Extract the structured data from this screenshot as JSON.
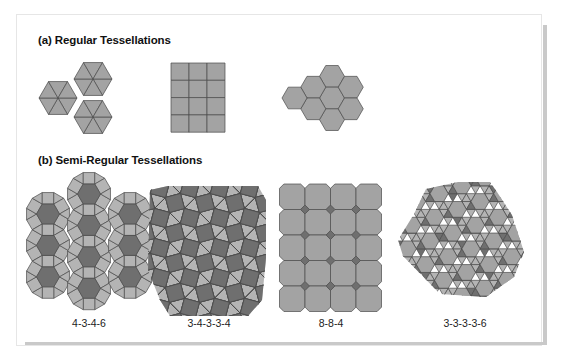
{
  "figure": {
    "section_a": {
      "title": "(a) Regular Tessellations",
      "items": [
        {
          "name": "triangles",
          "shape": "equilateral-triangle"
        },
        {
          "name": "squares",
          "shape": "square"
        },
        {
          "name": "hexagons",
          "shape": "regular-hexagon"
        }
      ]
    },
    "section_b": {
      "title": "(b) Semi-Regular Tessellations",
      "items": [
        {
          "label": "4-3-4-6"
        },
        {
          "label": "3-4-3-3-4"
        },
        {
          "label": "8-8-4"
        },
        {
          "label": "3-3-3-3-6"
        }
      ]
    }
  },
  "colors": {
    "light_fill": "#b4b4b4",
    "mid_fill": "#a3a3a3",
    "dark_fill": "#6f6f6f",
    "stroke": "#4a4a4a",
    "card_border": "#e6e6e6",
    "shadow": "#c9c9c9"
  }
}
